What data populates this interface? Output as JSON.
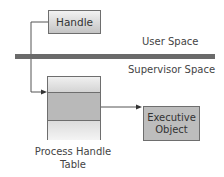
{
  "diagram": {
    "handle_box": {
      "label": "Handle"
    },
    "regions": {
      "user_space": "User Space",
      "supervisor_space": "Supervisor Space"
    },
    "process_handle_table": {
      "caption_line1": "Process Handle",
      "caption_line2": "Table",
      "rows": 3
    },
    "executive_object": {
      "line1": "Executive",
      "line2": "Object"
    },
    "connectors": [
      {
        "from": "handle_box",
        "to": "process_handle_table.row2"
      },
      {
        "from": "process_handle_table.row2",
        "to": "executive_object"
      }
    ],
    "colors": {
      "separator_bar": "#6a6a6a",
      "box_border": "#6e6e6e",
      "executive_fill": "#bdbdbd"
    }
  }
}
